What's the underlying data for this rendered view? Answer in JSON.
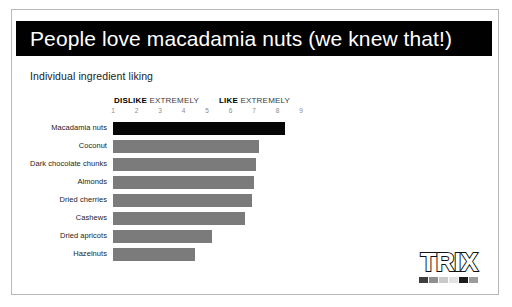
{
  "slide": {
    "title": "People love macadamia nuts (we knew that!)",
    "subtitle": "Individual ingredient liking"
  },
  "scale": {
    "dislike_bold": "DISLIKE",
    "dislike_rest": " EXTREMELY",
    "like_bold": "LIKE",
    "like_rest": " EXTREMELY",
    "ticks": [
      "1",
      "2",
      "3",
      "4",
      "5",
      "6",
      "7",
      "8",
      "9"
    ]
  },
  "logo": {
    "wordmark": "TRIX",
    "swatch_colors": [
      "#3d3d3d",
      "#8f8f8f",
      "#c9c9c9",
      "#e2e2e2",
      "#1b1b1b",
      "#9b9b9b"
    ]
  },
  "colors": {
    "bar_default": "#7b7b7b",
    "bar_highlight": "#060606",
    "banner": "#010101",
    "slide_border": "#b9b9b9"
  },
  "chart_data": {
    "type": "bar",
    "title": "Individual ingredient liking",
    "orientation": "horizontal",
    "xlabel": "",
    "ylabel": "",
    "xlim": [
      1,
      9
    ],
    "grid": false,
    "legend": false,
    "axis_annotations": [
      "DISLIKE EXTREMELY",
      "LIKE EXTREMELY"
    ],
    "tick_labels": [
      "1",
      "2",
      "3",
      "4",
      "5",
      "6",
      "7",
      "8",
      "9"
    ],
    "categories": [
      "Macadamia nuts",
      "Coconut",
      "Dark chocolate chunks",
      "Almonds",
      "Dried cherries",
      "Cashews",
      "Dried apricots",
      "Hazelnuts"
    ],
    "values": [
      8.3,
      7.2,
      7.1,
      7.0,
      6.9,
      6.6,
      5.2,
      4.5
    ],
    "highlight_index": 0
  }
}
